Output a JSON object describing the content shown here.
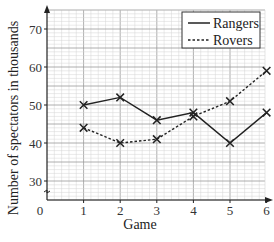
{
  "chart_data": {
    "type": "line",
    "title": "",
    "xlabel": "Game",
    "ylabel": "Number of spectators in thousands",
    "categories": [
      1,
      2,
      3,
      4,
      5,
      6
    ],
    "x": [
      1,
      2,
      3,
      4,
      5,
      6
    ],
    "series": [
      {
        "name": "Rangers",
        "style": "solid",
        "marker": "x",
        "values": [
          50,
          52,
          46,
          48,
          40,
          48
        ]
      },
      {
        "name": "Rovers",
        "style": "dashed",
        "marker": "x",
        "values": [
          44,
          40,
          41,
          47,
          51,
          59
        ]
      }
    ],
    "xlim": [
      0,
      6.5
    ],
    "ylim": [
      25,
      75
    ],
    "y_axis_break": true,
    "xticks": [
      "0",
      "1",
      "2",
      "3",
      "4",
      "5",
      "6"
    ],
    "yticks": [
      "30",
      "40",
      "50",
      "60",
      "70"
    ],
    "grid": true,
    "legend_position": "top-right"
  },
  "legend": {
    "items": [
      {
        "label": "Rangers",
        "style": "solid"
      },
      {
        "label": "Rovers",
        "style": "dashed"
      }
    ]
  },
  "colors": {
    "line": "#222222",
    "grid_minor": "#d4d4d4",
    "grid_major": "#9a9a9a",
    "axis": "#222222"
  }
}
